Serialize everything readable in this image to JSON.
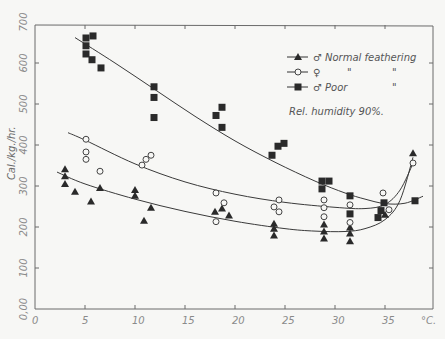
{
  "chart_data": {
    "type": "scatter",
    "title": "",
    "xlabel": "°C.",
    "ylabel": "Cal./kg./hr.",
    "xlim": [
      0,
      40
    ],
    "ylim": [
      0,
      700
    ],
    "xticks": [
      0,
      5,
      10,
      15,
      20,
      25,
      30,
      35
    ],
    "xtick_labels": [
      "0",
      "5",
      "10",
      "15",
      "20",
      "25",
      "30",
      "35"
    ],
    "yticks": [
      0,
      100,
      200,
      300,
      400,
      500,
      600,
      700
    ],
    "ytick_labels": [
      "0,00",
      "100",
      "200",
      "300",
      "400",
      "500",
      "600",
      "700"
    ],
    "grid": false,
    "legend_position": "upper right",
    "annotation": "Rel. humidity 90%",
    "series": [
      {
        "name": "♂ Normal feathering",
        "marker": "filled-triangle",
        "color": "#111111",
        "points": [
          [
            3,
            341
          ],
          [
            3,
            324
          ],
          [
            3,
            305
          ],
          [
            4,
            286
          ],
          [
            5.6,
            262
          ],
          [
            6.5,
            295
          ],
          [
            10,
            290
          ],
          [
            10,
            276
          ],
          [
            11.6,
            247
          ],
          [
            10.9,
            215
          ],
          [
            18,
            237
          ],
          [
            18.7,
            245
          ],
          [
            19.4,
            228
          ],
          [
            23.9,
            208
          ],
          [
            23.9,
            196
          ],
          [
            23.9,
            179
          ],
          [
            28.9,
            206
          ],
          [
            28.9,
            189
          ],
          [
            28.9,
            172
          ],
          [
            31.5,
            199
          ],
          [
            31.5,
            184
          ],
          [
            31.5,
            165
          ],
          [
            35,
            230
          ],
          [
            37.8,
            380
          ]
        ],
        "fit_curve": [
          [
            2.2,
            334
          ],
          [
            5,
            305
          ],
          [
            10,
            268
          ],
          [
            15,
            238
          ],
          [
            20,
            214
          ],
          [
            25,
            196
          ],
          [
            28,
            190
          ],
          [
            31,
            189
          ],
          [
            33,
            196
          ],
          [
            35,
            218
          ],
          [
            36.5,
            265
          ],
          [
            37.8,
            370
          ]
        ]
      },
      {
        "name": "♀ \" \"",
        "marker": "open-circle",
        "color": "#111111",
        "points": [
          [
            5.1,
            414
          ],
          [
            5.1,
            383
          ],
          [
            5.1,
            365
          ],
          [
            6.5,
            336
          ],
          [
            10.7,
            351
          ],
          [
            11.1,
            365
          ],
          [
            11.6,
            375
          ],
          [
            18.1,
            283
          ],
          [
            18.9,
            259
          ],
          [
            18.1,
            213
          ],
          [
            24.4,
            266
          ],
          [
            23.9,
            249
          ],
          [
            24.4,
            237
          ],
          [
            28.9,
            266
          ],
          [
            28.9,
            247
          ],
          [
            28.9,
            225
          ],
          [
            31.5,
            254
          ],
          [
            31.5,
            211
          ],
          [
            34.8,
            283
          ],
          [
            35.4,
            242
          ],
          [
            37.8,
            356
          ]
        ],
        "fit_curve": [
          [
            3.3,
            430
          ],
          [
            5,
            412
          ],
          [
            10,
            354
          ],
          [
            15,
            310
          ],
          [
            20,
            280
          ],
          [
            25,
            260
          ],
          [
            30,
            248
          ],
          [
            33,
            245
          ],
          [
            35,
            255
          ],
          [
            36.5,
            290
          ],
          [
            37.8,
            355
          ]
        ]
      },
      {
        "name": "♂ Poor \"",
        "marker": "filled-square",
        "color": "#111111",
        "points": [
          [
            5.1,
            661
          ],
          [
            5.8,
            666
          ],
          [
            5.1,
            642
          ],
          [
            5.1,
            622
          ],
          [
            5.7,
            608
          ],
          [
            6.6,
            588
          ],
          [
            11.9,
            542
          ],
          [
            11.9,
            516
          ],
          [
            11.9,
            467
          ],
          [
            18.7,
            492
          ],
          [
            18.1,
            472
          ],
          [
            18.7,
            443
          ],
          [
            23.7,
            375
          ],
          [
            24.3,
            397
          ],
          [
            24.9,
            404
          ],
          [
            28.7,
            312
          ],
          [
            29.4,
            312
          ],
          [
            28.7,
            293
          ],
          [
            31.5,
            276
          ],
          [
            31.5,
            232
          ],
          [
            34.9,
            259
          ],
          [
            34.6,
            240
          ],
          [
            34.3,
            223
          ],
          [
            38,
            264
          ]
        ],
        "fit_curve": [
          [
            4,
            662
          ],
          [
            8,
            600
          ],
          [
            12,
            535
          ],
          [
            16,
            470
          ],
          [
            20,
            410
          ],
          [
            24,
            358
          ],
          [
            28,
            312
          ],
          [
            31,
            283
          ],
          [
            33,
            268
          ],
          [
            35,
            257
          ],
          [
            37,
            258
          ],
          [
            38.8,
            275
          ]
        ]
      }
    ]
  },
  "legend": {
    "items": [
      {
        "symbol": "♂",
        "label": "Normal feathering",
        "ditto": ""
      },
      {
        "symbol": "♀",
        "label": "\"",
        "ditto": "\""
      },
      {
        "symbol": "♂",
        "label": "Poor",
        "ditto": "\""
      }
    ],
    "note": "Rel. humidity  90%."
  }
}
